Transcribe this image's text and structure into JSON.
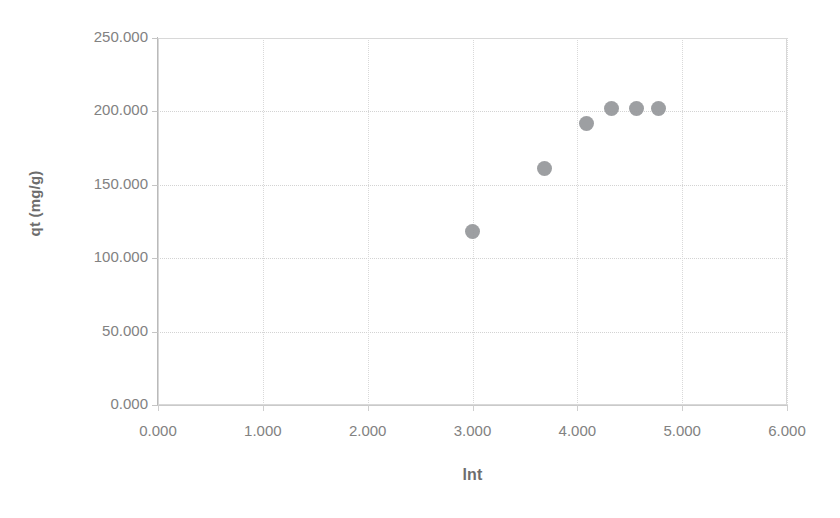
{
  "chart_data": {
    "type": "scatter",
    "title": "",
    "xlabel": "lnt",
    "ylabel": "qt (mg/g)",
    "xlim": [
      0,
      6
    ],
    "ylim": [
      0,
      250
    ],
    "x_ticks": [
      "0.000",
      "1.000",
      "2.000",
      "3.000",
      "4.000",
      "5.000",
      "6.000"
    ],
    "y_ticks": [
      "0.000",
      "50.000",
      "100.000",
      "150.000",
      "200.000",
      "250.000"
    ],
    "x_tick_values": [
      0,
      1,
      2,
      3,
      4,
      5,
      6
    ],
    "y_tick_values": [
      0,
      50,
      100,
      150,
      200,
      250
    ],
    "grid": true,
    "legend": false,
    "marker_color": "#949699",
    "marker_shape": "circle",
    "series": [
      {
        "name": "qt",
        "points": [
          {
            "x": 3.0,
            "y": 118.0
          },
          {
            "x": 3.69,
            "y": 161.0
          },
          {
            "x": 4.09,
            "y": 192.0
          },
          {
            "x": 4.33,
            "y": 202.0
          },
          {
            "x": 4.56,
            "y": 202.0
          },
          {
            "x": 4.77,
            "y": 202.0
          }
        ]
      }
    ]
  },
  "axes": {
    "x_title": "lnt",
    "y_title": "qt (mg/g)"
  },
  "colors": {
    "marker": "#949699",
    "gridline": "#d3d3d3",
    "axis": "#b9b9b9",
    "text": "#808080",
    "background": "#ffffff"
  }
}
